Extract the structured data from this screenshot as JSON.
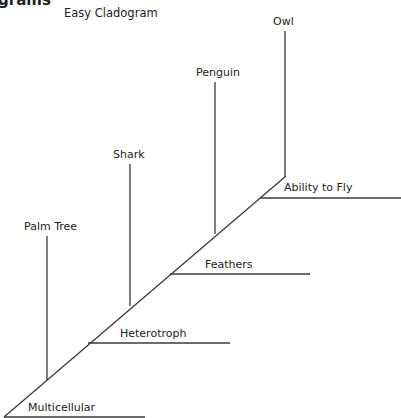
{
  "header": {
    "heading_fragment": "grams",
    "title": "Easy Cladogram"
  },
  "taxa": [
    {
      "name": "Palm Tree"
    },
    {
      "name": "Shark"
    },
    {
      "name": "Penguin"
    },
    {
      "name": "Owl"
    }
  ],
  "characters": [
    {
      "name": "Multicellular"
    },
    {
      "name": "Heterotroph"
    },
    {
      "name": "Feathers"
    },
    {
      "name": "Ability to Fly"
    }
  ],
  "colors": {
    "line": "#3a3a3a",
    "text": "#222222",
    "background": "#ffffff"
  }
}
